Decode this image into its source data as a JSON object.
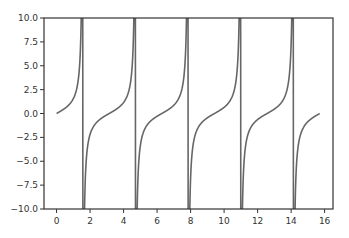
{
  "chart_data": {
    "type": "line",
    "title": "",
    "xlabel": "",
    "ylabel": "",
    "function": "tan(x)",
    "x_range": [
      0,
      15.708
    ],
    "xlim": [
      -0.75,
      16.5
    ],
    "ylim": [
      -10,
      10
    ],
    "grid": false,
    "legend": null,
    "x_ticks": [
      0,
      2,
      4,
      6,
      8,
      10,
      12,
      14,
      16
    ],
    "x_tick_labels": [
      "0",
      "2",
      "4",
      "6",
      "8",
      "10",
      "12",
      "14",
      "16"
    ],
    "y_ticks": [
      10,
      7.5,
      5,
      2.5,
      0,
      -2.5,
      -5,
      -7.5,
      -10
    ],
    "y_tick_labels": [
      "10.0",
      "7.5",
      "5.0",
      "2.5",
      "0.0",
      "−2.5",
      "−5.0",
      "−7.5",
      "−10.0"
    ],
    "asymptotes_x": [
      1.571,
      4.712,
      7.854,
      10.996,
      14.137
    ],
    "series": [
      {
        "name": "tan(x)",
        "color": "#666666",
        "x": [
          0,
          0.5,
          1.0,
          1.3,
          1.5,
          1.571,
          2.0,
          2.5,
          3.1416,
          3.8,
          4.2,
          4.712,
          6.283,
          7.854,
          9.425,
          10.996,
          12.566,
          14.137,
          15.708
        ],
        "values": [
          0,
          0.55,
          1.56,
          3.6,
          14.1,
          10,
          -2.19,
          -0.75,
          0,
          0.93,
          1.78,
          10,
          0,
          10,
          0,
          10,
          0,
          10,
          0
        ]
      }
    ]
  },
  "colors": {
    "line": "#666666",
    "axes": "#333333",
    "background": "#ffffff"
  }
}
